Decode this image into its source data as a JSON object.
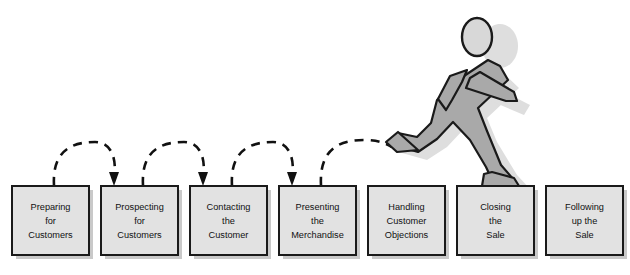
{
  "diagram": {
    "type": "process-flow",
    "canvas": {
      "width": 630,
      "height": 275
    },
    "colors": {
      "box_fill": "#e2e2e2",
      "box_border": "#1a1a1a",
      "box_shadow": "#c9c9c9",
      "figure_fill": "#a9a9a9",
      "figure_border": "#1a1a1a",
      "head_fill": "#d8d8d8",
      "arc_stroke": "#111111",
      "page_background": "#ffffff",
      "label_text": "#111111"
    },
    "steps": [
      {
        "id": "step-1",
        "index": 1,
        "lines": [
          "Preparing",
          "for",
          "Customers"
        ],
        "x": 12,
        "y": 186,
        "w": 77,
        "h": 69
      },
      {
        "id": "step-2",
        "index": 2,
        "lines": [
          "Prospecting",
          "for",
          "Customers"
        ],
        "x": 101,
        "y": 186,
        "w": 77,
        "h": 69
      },
      {
        "id": "step-3",
        "index": 3,
        "lines": [
          "Contacting",
          "the",
          "Customer"
        ],
        "x": 190,
        "y": 186,
        "w": 77,
        "h": 69
      },
      {
        "id": "step-4",
        "index": 4,
        "lines": [
          "Presenting",
          "the",
          "Merchandise"
        ],
        "x": 279,
        "y": 186,
        "w": 77,
        "h": 69
      },
      {
        "id": "step-5",
        "index": 5,
        "lines": [
          "Handling",
          "Customer",
          "Objections"
        ],
        "x": 368,
        "y": 186,
        "w": 77,
        "h": 69
      },
      {
        "id": "step-6",
        "index": 6,
        "lines": [
          "Closing",
          "the",
          "Sale"
        ],
        "x": 457,
        "y": 186,
        "w": 77,
        "h": 69
      },
      {
        "id": "step-7",
        "index": 7,
        "lines": [
          "Following",
          "up the",
          "Sale"
        ],
        "x": 546,
        "y": 186,
        "w": 77,
        "h": 69
      }
    ],
    "arcs": [
      {
        "id": "arc-1-2",
        "from": "step-1",
        "to": "step-2",
        "start_x": 54,
        "end_x": 113,
        "apex_y": 143
      },
      {
        "id": "arc-2-3",
        "from": "step-2",
        "to": "step-3",
        "start_x": 143,
        "end_x": 202,
        "apex_y": 143
      },
      {
        "id": "arc-3-4",
        "from": "step-3",
        "to": "step-4",
        "start_x": 232,
        "end_x": 291,
        "apex_y": 143
      },
      {
        "id": "arc-4-5",
        "from": "step-4",
        "to": "step-5",
        "start_x": 321,
        "end_x": 376,
        "apex_y": 141
      }
    ],
    "figure": {
      "id": "running-figure",
      "description": "running stick figure leaping onto the Closing the Sale box",
      "head": {
        "cx": 477,
        "cy": 37,
        "rx": 15,
        "ry": 19
      },
      "landing_step": "step-6"
    }
  }
}
